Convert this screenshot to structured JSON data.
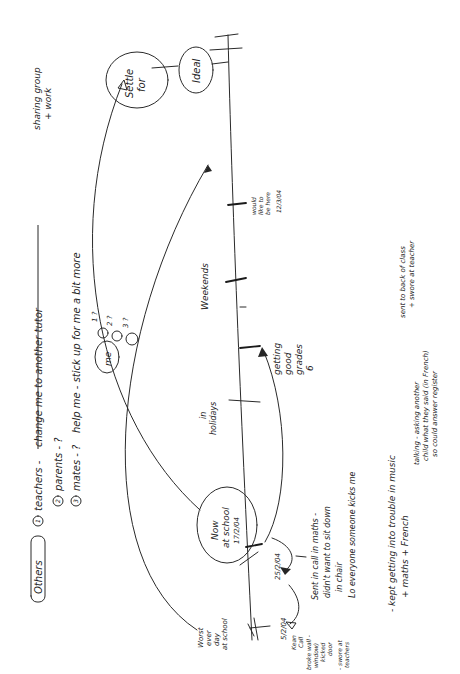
{
  "diagram": {
    "type": "handwritten-timeline",
    "orientation": "rotated-90-ccw",
    "ink_color": "#262626",
    "paper_color": "#ffffff",
    "others_block": {
      "heading": "Others",
      "items": [
        {
          "num": "1",
          "label": "teachers -",
          "struck": "change me to another tutor"
        },
        {
          "num": "2",
          "label": "parents - ?"
        },
        {
          "num": "3",
          "label": "mates - ?",
          "note": "help me - stick up for me a bit more"
        }
      ],
      "side_note_line1": "sharing group",
      "side_note_line2": "+ work"
    },
    "me_cluster": {
      "label": "me",
      "marks": [
        "1 ?",
        "2 ?",
        "3 ?"
      ]
    },
    "timeline_nodes": [
      {
        "id": "worst",
        "lines": [
          "Worst",
          "ever",
          "day",
          "at school"
        ]
      },
      {
        "id": "now",
        "lines": [
          "Now",
          "at school",
          "17/2/04"
        ]
      },
      {
        "id": "holidays",
        "lines": [
          "in",
          "holidays"
        ]
      },
      {
        "id": "grades",
        "lines": [
          "getting",
          "good",
          "grades",
          "6"
        ]
      },
      {
        "id": "weekends",
        "lines": [
          "Weekends"
        ]
      },
      {
        "id": "would_like",
        "lines": [
          "would",
          "like to",
          "be here",
          "12/3/04"
        ]
      },
      {
        "id": "settle",
        "lines": [
          "Settle",
          "for"
        ]
      },
      {
        "id": "ideal",
        "lines": [
          "Ideal"
        ]
      }
    ],
    "dates": {
      "d1": "5/2/04",
      "d2": "25/2/04"
    },
    "left_notes": [
      "Kean",
      "Call",
      "broke wall -",
      "window)",
      "kicked",
      "door",
      "- swore at",
      "teachers"
    ],
    "middle_notes": [
      "Sent in call in maths -",
      "didn't want to sit down",
      "in chair",
      "Lo everyone someone kicks me"
    ],
    "bottom_notes": {
      "line1": "- kept getting into trouble in music",
      "line2": "+ maths + French",
      "music_note_1": "sent to back of class",
      "music_note_2": "+ swore at teacher",
      "french_note_1": "talking - asking another",
      "french_note_2": "child what they said (in French)",
      "french_note_3": "so could answer register"
    }
  }
}
